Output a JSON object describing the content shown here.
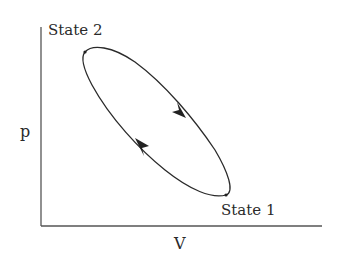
{
  "diagram": {
    "type": "p-V cycle diagram",
    "axes": {
      "x_label": "V",
      "y_label": "p"
    },
    "states": [
      {
        "label": "State 2",
        "position": "upper-left"
      },
      {
        "label": "State 1",
        "position": "lower-right"
      }
    ],
    "cycle_direction": "clockwise"
  }
}
